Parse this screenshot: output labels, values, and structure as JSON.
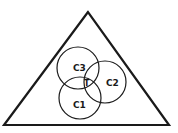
{
  "diagram": {
    "stroke_color": "#1a1a1a",
    "background": "#ffffff",
    "triangle": {
      "points": "88,12 4,125 169,125"
    },
    "circles": [
      {
        "id": "C3",
        "label": "C3",
        "cx": 78,
        "cy": 68,
        "r": 21,
        "label_x": 75,
        "label_y": 72
      },
      {
        "id": "C2",
        "label": "C2",
        "cx": 105,
        "cy": 82,
        "r": 21,
        "label_x": 110,
        "label_y": 86
      },
      {
        "id": "C1",
        "label": "C1",
        "cx": 80,
        "cy": 98,
        "r": 21,
        "label_x": 76,
        "label_y": 109
      }
    ],
    "intersection": {
      "label": "T",
      "x": 86,
      "y": 87
    }
  }
}
